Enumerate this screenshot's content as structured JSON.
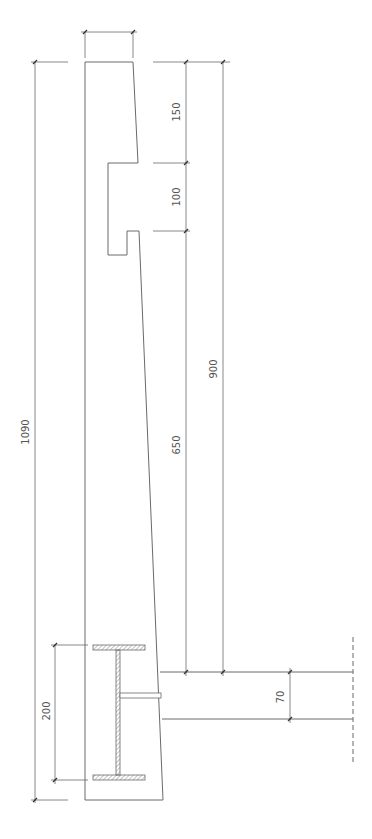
{
  "drawing": {
    "type": "structural section - cantilever wall with embedded steel I-beam",
    "colors": {
      "line": "#6a6a6a",
      "hatch": "#888888",
      "text": "#555555",
      "background": "#ffffff"
    },
    "dimensions": {
      "total_height": "1090",
      "top_segment": "150",
      "notch_segment": "100",
      "lower_segment": "650",
      "combined_height": "900",
      "beam_depth": "200",
      "slab_thickness": "70",
      "top_width": ""
    }
  }
}
